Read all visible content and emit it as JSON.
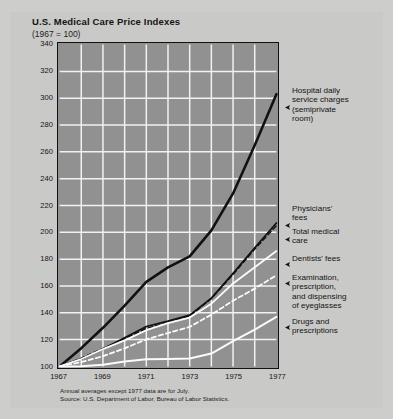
{
  "title": "U.S. Medical Care Price Indexes",
  "subtitle": "(1967 = 100)",
  "footnote": {
    "line1": "Annual averages except 1977 data are for July.",
    "line2": "Source: U.S. Department of Labor, Bureau of Labor Statistics."
  },
  "callouts": {
    "hospital": "Hospital daily\nservice charges\n(semiprivate\nroom)",
    "physicians": "Physicians'\nfees",
    "total": "Total medical\ncare",
    "dentists": "Dentists' fees",
    "eyeglasses": "Examination,\nprescription,\nand dispensing\nof eyeglasses",
    "drugs": "Drugs and\nprescriptions"
  },
  "colors": {
    "page_background": "#c9c9c7",
    "plot_background": "#919191",
    "gridline": "#f2f2f2",
    "axis": "#111111",
    "dark_series": "#111111",
    "light_series": "#fbfbfb",
    "text": "#141414"
  },
  "chart_data": {
    "type": "line",
    "title": "U.S. Medical Care Price Indexes",
    "subtitle": "(1967 = 100)",
    "xlabel": "",
    "ylabel": "",
    "xlim": [
      1967,
      1977
    ],
    "ylim": [
      100,
      340
    ],
    "yticks": [
      100,
      120,
      140,
      160,
      180,
      200,
      220,
      240,
      260,
      280,
      300,
      320,
      340
    ],
    "xticks": [
      1967,
      1969,
      1971,
      1973,
      1975,
      1977
    ],
    "xtick_labels": [
      "1967",
      "1969",
      "1971",
      "1973",
      "1975",
      "1977"
    ],
    "x_minor_step": 1,
    "grid": true,
    "legend_position": "right-callouts",
    "x": [
      1967,
      1968,
      1969,
      1970,
      1971,
      1972,
      1973,
      1974,
      1975,
      1976,
      1977
    ],
    "series": [
      {
        "name": "Hospital daily service charges (semiprivate room)",
        "style": "solid",
        "color": "#111111",
        "width": 2.6,
        "values": [
          100,
          113.6,
          128.8,
          145.4,
          163.1,
          173.9,
          182.1,
          201.5,
          229.0,
          265.0,
          303.0
        ]
      },
      {
        "name": "Physicians' fees",
        "style": "solid",
        "color": "#111111",
        "width": 1.7,
        "values": [
          100,
          105.6,
          112.9,
          121.4,
          129.8,
          133.8,
          138.2,
          150.9,
          169.4,
          188.5,
          207.0
        ]
      },
      {
        "name": "Total medical care",
        "style": "dashed",
        "color": "#111111",
        "width": 1.5,
        "values": [
          100,
          106.1,
          113.4,
          120.6,
          128.4,
          132.5,
          137.7,
          150.5,
          168.6,
          187.5,
          205.0
        ]
      },
      {
        "name": "Dentists' fees",
        "style": "solid",
        "color": "#fbfbfb",
        "width": 1.8,
        "values": [
          100,
          105.5,
          112.9,
          119.4,
          127.0,
          132.3,
          136.4,
          146.8,
          161.9,
          174.0,
          186.0
        ]
      },
      {
        "name": "Examination, prescription, and dispensing of eyeglasses",
        "style": "dashed",
        "color": "#fbfbfb",
        "width": 1.8,
        "values": [
          100,
          103.2,
          107.6,
          113.5,
          120.2,
          124.9,
          129.5,
          138.6,
          149.0,
          158.0,
          168.0
        ]
      },
      {
        "name": "Drugs and prescriptions",
        "style": "solid",
        "color": "#fbfbfb",
        "width": 2.0,
        "values": [
          100,
          100.2,
          101.3,
          103.6,
          105.4,
          105.6,
          105.9,
          109.6,
          118.8,
          127.5,
          137.0
        ]
      }
    ]
  }
}
